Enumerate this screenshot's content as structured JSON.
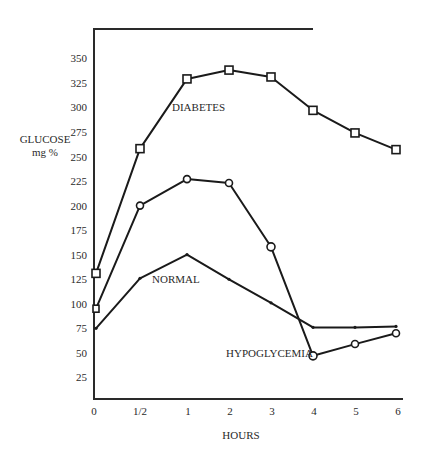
{
  "chart_data": {
    "type": "line",
    "title": "",
    "xlabel": "HOURS",
    "ylabel": "GLUCOSE mg %",
    "ylabel_lines": [
      "GLUCOSE",
      "mg %"
    ],
    "x": [
      0,
      0.5,
      1,
      2,
      3,
      4,
      5,
      6
    ],
    "x_tick_labels": [
      "0",
      "1/2",
      "1",
      "2",
      "3",
      "4",
      "5",
      "6"
    ],
    "y_ticks": [
      25,
      50,
      75,
      100,
      125,
      150,
      175,
      200,
      225,
      250,
      275,
      300,
      325,
      350
    ],
    "ylim": [
      0,
      375
    ],
    "xlim": [
      0,
      6
    ],
    "grid": false,
    "legend": "inline labels",
    "series": [
      {
        "name": "DIABETES",
        "marker": "square",
        "values": [
          131,
          258,
          329,
          338,
          331,
          297,
          274,
          257
        ]
      },
      {
        "name": "HYPOGLYCEMIA",
        "marker": "circle",
        "values": [
          95,
          200,
          227,
          223,
          158,
          47,
          59,
          70
        ]
      },
      {
        "name": "NORMAL",
        "marker": "dot",
        "values": [
          75,
          126,
          150,
          125,
          101,
          76,
          76,
          77
        ]
      }
    ]
  }
}
